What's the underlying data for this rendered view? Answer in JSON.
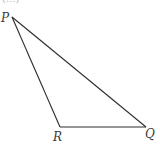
{
  "figure": {
    "type": "triangle",
    "top_fragment": "(...)",
    "vertices": [
      {
        "name": "P",
        "x": 12,
        "y": 17,
        "label_x": 1,
        "label_y": 22
      },
      {
        "name": "R",
        "x": 60,
        "y": 127,
        "label_x": 53,
        "label_y": 141
      },
      {
        "name": "Q",
        "x": 146,
        "y": 127,
        "label_x": 145,
        "label_y": 138
      }
    ],
    "edges": [
      [
        "P",
        "Q"
      ],
      [
        "P",
        "R"
      ],
      [
        "R",
        "Q"
      ]
    ]
  }
}
